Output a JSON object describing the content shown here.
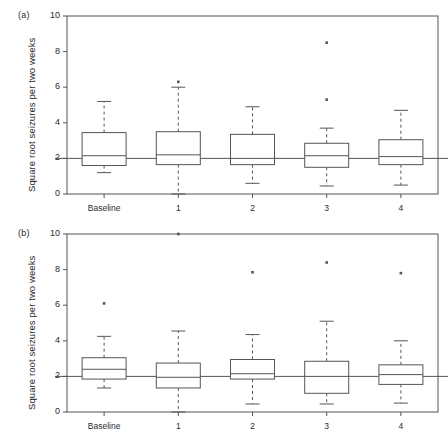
{
  "figure": {
    "width": 448,
    "height": 436,
    "background": "#ffffff",
    "line_color": "#555555",
    "text_color": "#2b2b2b"
  },
  "panels": [
    {
      "tag": "(a)",
      "ylabel": "Square root seizures per two weeks",
      "yticks": [
        "0",
        "2",
        "4",
        "6",
        "8",
        "10"
      ]
    },
    {
      "tag": "(b)",
      "ylabel": "Square root seizures per two weeks",
      "yticks": [
        "0",
        "2",
        "4",
        "6",
        "8",
        "10"
      ]
    }
  ],
  "chart_data": [
    {
      "type": "box",
      "panel": "(a)",
      "title": "",
      "xlabel": "",
      "ylabel": "Square root seizures per two weeks",
      "ylim": [
        0,
        10
      ],
      "yticks": [
        0,
        2,
        4,
        6,
        8,
        10
      ],
      "grid": false,
      "legend": "none",
      "reference_line": 2,
      "categories": [
        "Baseline",
        "1",
        "2",
        "3",
        "4"
      ],
      "boxes": [
        {
          "category": "Baseline",
          "whisker_low": 1.2,
          "q1": 1.6,
          "median": 2.15,
          "q3": 3.45,
          "whisker_high": 5.2,
          "outliers": []
        },
        {
          "category": "1",
          "whisker_low": 0.0,
          "q1": 1.65,
          "median": 2.2,
          "q3": 3.5,
          "whisker_high": 6.0,
          "outliers": [
            6.3
          ]
        },
        {
          "category": "2",
          "whisker_low": 0.6,
          "q1": 1.65,
          "median": 2.0,
          "q3": 3.35,
          "whisker_high": 4.9,
          "outliers": []
        },
        {
          "category": "3",
          "whisker_low": 0.45,
          "q1": 1.5,
          "median": 2.15,
          "q3": 2.85,
          "whisker_high": 3.7,
          "outliers": [
            5.3,
            8.5
          ]
        },
        {
          "category": "4",
          "whisker_low": 0.5,
          "q1": 1.65,
          "median": 2.1,
          "q3": 3.05,
          "whisker_high": 4.7,
          "outliers": []
        }
      ]
    },
    {
      "type": "box",
      "panel": "(b)",
      "title": "",
      "xlabel": "",
      "ylabel": "Square root seizures per two weeks",
      "ylim": [
        0,
        10
      ],
      "yticks": [
        0,
        2,
        4,
        6,
        8,
        10
      ],
      "grid": false,
      "legend": "none",
      "reference_line": 2,
      "categories": [
        "Baseline",
        "1",
        "2",
        "3",
        "4"
      ],
      "boxes": [
        {
          "category": "Baseline",
          "whisker_low": 1.35,
          "q1": 1.85,
          "median": 2.4,
          "q3": 3.05,
          "whisker_high": 4.25,
          "outliers": [
            6.1
          ]
        },
        {
          "category": "1",
          "whisker_low": 0.0,
          "q1": 1.35,
          "median": 1.95,
          "q3": 2.75,
          "whisker_high": 4.55,
          "outliers": [
            10.0
          ]
        },
        {
          "category": "2",
          "whisker_low": 0.45,
          "q1": 1.85,
          "median": 2.15,
          "q3": 2.95,
          "whisker_high": 4.35,
          "outliers": [
            7.85
          ]
        },
        {
          "category": "3",
          "whisker_low": 0.45,
          "q1": 1.05,
          "median": 2.0,
          "q3": 2.85,
          "whisker_high": 5.1,
          "outliers": [
            8.4
          ]
        },
        {
          "category": "4",
          "whisker_low": 0.5,
          "q1": 1.55,
          "median": 2.1,
          "q3": 2.65,
          "whisker_high": 4.0,
          "outliers": [
            7.8
          ]
        }
      ]
    }
  ]
}
